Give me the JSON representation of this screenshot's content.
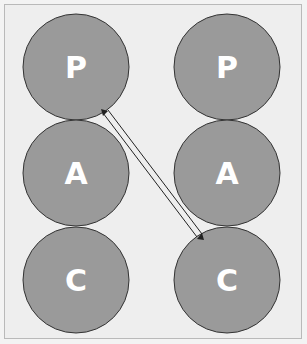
{
  "diagram": {
    "colors": {
      "background": "#eeeeee",
      "circle_fill": "#9a9a9a",
      "circle_stroke": "#333333",
      "label": "#ffffff",
      "arrow": "#222222"
    },
    "left_column": [
      {
        "label": "P",
        "cx": 76,
        "cy": 67
      },
      {
        "label": "A",
        "cx": 76,
        "cy": 173
      },
      {
        "label": "C",
        "cx": 76,
        "cy": 280
      }
    ],
    "right_column": [
      {
        "label": "P",
        "cx": 227,
        "cy": 67
      },
      {
        "label": "A",
        "cx": 227,
        "cy": 173
      },
      {
        "label": "C",
        "cx": 227,
        "cy": 280
      }
    ],
    "radius": 53,
    "arrow": {
      "from": "left P",
      "to": "right C",
      "type": "double-line bidirectional"
    }
  }
}
